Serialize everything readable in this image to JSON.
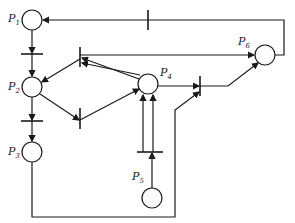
{
  "diagram": {
    "type": "petri-net",
    "places": [
      {
        "id": "P1",
        "label": "P",
        "sub": "1",
        "cx": 32,
        "cy": 20
      },
      {
        "id": "P2",
        "label": "P",
        "sub": "2",
        "cx": 32,
        "cy": 87
      },
      {
        "id": "P3",
        "label": "P",
        "sub": "3",
        "cx": 32,
        "cy": 152
      },
      {
        "id": "P4",
        "label": "P",
        "sub": "4",
        "cx": 148,
        "cy": 84
      },
      {
        "id": "P5",
        "label": "P",
        "sub": "5",
        "cx": 152,
        "cy": 198
      },
      {
        "id": "P6",
        "label": "P",
        "sub": "6",
        "cx": 265,
        "cy": 55
      }
    ],
    "colors": {
      "stroke": "#1a1a1a",
      "background": "#ffffff"
    }
  }
}
